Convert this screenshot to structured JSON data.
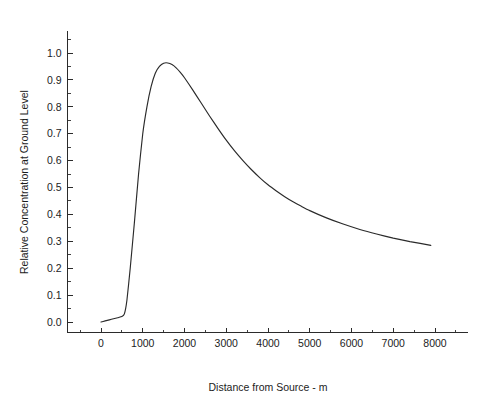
{
  "chart_data": {
    "type": "line",
    "title": "",
    "subtitle": "",
    "xlabel": "Distance from Source - m",
    "ylabel": "Relative Concentration at Ground Level",
    "xlim": [
      -800,
      8800
    ],
    "ylim": [
      -0.04,
      1.08
    ],
    "xticks": [
      0,
      1000,
      2000,
      3000,
      4000,
      5000,
      6000,
      7000,
      8000
    ],
    "xticklabels": [
      "0",
      "1000",
      "2000",
      "3000",
      "4000",
      "5000",
      "6000",
      "7000",
      "8000"
    ],
    "yticks": [
      0.0,
      0.1,
      0.2,
      0.3,
      0.4,
      0.5,
      0.6,
      0.7,
      0.8,
      0.9,
      1.0
    ],
    "yticklabels": [
      "0.0",
      "0.1",
      "0.2",
      "0.3",
      "0.4",
      "0.5",
      "0.6",
      "0.7",
      "0.8",
      "0.9",
      "1.0"
    ],
    "x_minor_ticks_per_interval": 1,
    "y_minor_ticks_per_interval": 1,
    "grid": false,
    "legend": null,
    "legend_position": "none",
    "spines": [
      "left",
      "bottom"
    ],
    "line_color": "#2a2a2a",
    "line_width": 1.15,
    "background_color": "#ffffff",
    "annotations": [],
    "series": [
      {
        "name": "Relative ground-level concentration",
        "x": [
          0,
          100,
          200,
          300,
          400,
          500,
          560,
          620,
          700,
          800,
          900,
          1000,
          1100,
          1200,
          1300,
          1400,
          1500,
          1600,
          1700,
          1800,
          1900,
          2000,
          2200,
          2400,
          2600,
          2800,
          3000,
          3200,
          3400,
          3600,
          3800,
          4000,
          4200,
          4400,
          4600,
          4800,
          5000,
          5400,
          5800,
          6200,
          6600,
          7000,
          7400,
          7900
        ],
        "y": [
          0.0,
          0.004,
          0.008,
          0.012,
          0.016,
          0.02,
          0.03,
          0.08,
          0.2,
          0.37,
          0.55,
          0.7,
          0.8,
          0.875,
          0.925,
          0.95,
          0.962,
          0.963,
          0.957,
          0.945,
          0.928,
          0.908,
          0.862,
          0.814,
          0.766,
          0.72,
          0.676,
          0.636,
          0.6,
          0.567,
          0.537,
          0.51,
          0.487,
          0.466,
          0.447,
          0.43,
          0.414,
          0.387,
          0.364,
          0.344,
          0.327,
          0.312,
          0.299,
          0.285
        ]
      }
    ],
    "peak": {
      "x": 1650,
      "y": 0.963
    },
    "endpoint": {
      "x": 7900,
      "y": 0.285
    }
  },
  "figure": {
    "alt_description": "Line plot of relative concentration at ground level versus distance from source"
  }
}
